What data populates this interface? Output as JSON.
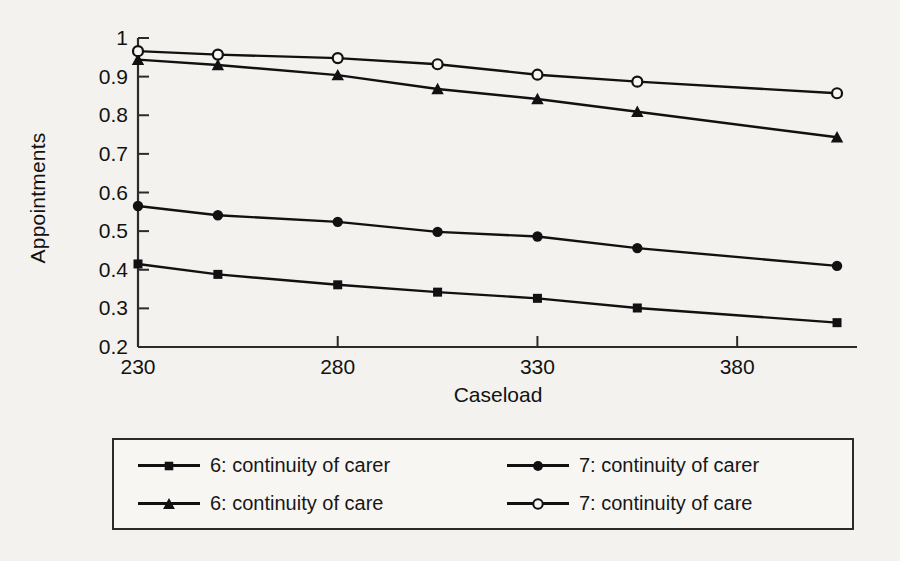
{
  "chart_data": {
    "type": "line",
    "title": "",
    "xlabel": "Caseload",
    "ylabel": "Appointments",
    "xlim": [
      230,
      410
    ],
    "ylim": [
      0.2,
      1.0
    ],
    "grid": false,
    "legend_position": "bottom",
    "xticks": [
      230,
      280,
      330,
      380
    ],
    "xtick_labels": [
      "230",
      "280",
      "330",
      "380"
    ],
    "yticks": [
      0.2,
      0.3,
      0.4,
      0.5,
      0.6,
      0.7,
      0.8,
      0.9,
      1
    ],
    "ytick_labels": [
      "0.2",
      "0.3",
      "0.4",
      "0.5",
      "0.6",
      "0.7",
      "0.8",
      "0.9",
      "1"
    ],
    "x": [
      230,
      250,
      280,
      305,
      330,
      355,
      405
    ],
    "series": [
      {
        "name": "6: continuity of carer",
        "marker": "filled-square",
        "values": [
          0.415,
          0.388,
          0.361,
          0.342,
          0.326,
          0.301,
          0.263
        ]
      },
      {
        "name": "6: continuity of care",
        "marker": "filled-triangle",
        "values": [
          0.944,
          0.93,
          0.904,
          0.868,
          0.842,
          0.809,
          0.743
        ]
      },
      {
        "name": "7: continuity of carer",
        "marker": "filled-circle",
        "values": [
          0.565,
          0.541,
          0.524,
          0.498,
          0.486,
          0.456,
          0.41
        ]
      },
      {
        "name": "7: continuity of care",
        "marker": "open-circle",
        "values": [
          0.966,
          0.957,
          0.948,
          0.932,
          0.905,
          0.887,
          0.857
        ]
      }
    ]
  },
  "legend": {
    "entries": [
      {
        "label": "6: continuity of carer",
        "marker": "filled-square"
      },
      {
        "label": "7: continuity of carer",
        "marker": "filled-circle"
      },
      {
        "label": "6: continuity of care",
        "marker": "filled-triangle"
      },
      {
        "label": "7: continuity of care",
        "marker": "open-circle"
      }
    ]
  },
  "colors": {
    "line": "#111111",
    "axis": "#2b2b2b",
    "background": "#f4f2ee",
    "legend_background": "#f7f6f3"
  }
}
